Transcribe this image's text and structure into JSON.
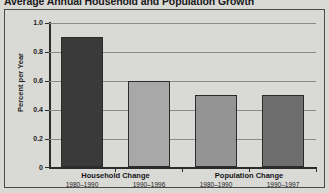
{
  "chart_data": {
    "type": "bar",
    "title": "Average Annual Household and Population Growth",
    "xlabel": "",
    "ylabel": "Percent per Year",
    "ylim": [
      0,
      1.0
    ],
    "ytick_labels": [
      "1.0",
      "0.8",
      "0.6",
      "0.4",
      "0.2",
      "0"
    ],
    "ytick_values": [
      1.0,
      0.8,
      0.6,
      0.4,
      0.2,
      0
    ],
    "grid": true,
    "legend": "none",
    "categories": [
      "1980–1990",
      "1990–1996",
      "1980–1990",
      "1990–1997"
    ],
    "values": [
      0.9,
      0.6,
      0.5,
      0.5
    ],
    "bar_colors": [
      "#3a3a3a",
      "#a8a8a8",
      "#949494",
      "#6e6e6e"
    ],
    "groups": [
      {
        "label": "Household Change",
        "bars": [
          {
            "range": "1980–1990",
            "value": 0.9,
            "color": "#3a3a3a"
          },
          {
            "range": "1990–1996",
            "value": 0.6,
            "color": "#a8a8a8"
          }
        ]
      },
      {
        "label": "Population Change",
        "bars": [
          {
            "range": "1980–1990",
            "value": 0.5,
            "color": "#949494"
          },
          {
            "range": "1990–1997",
            "value": 0.5,
            "color": "#6e6e6e"
          }
        ]
      }
    ]
  },
  "colors": {
    "background": "#d9d9d6",
    "axis": "#2b2b2b",
    "gridline": "#8a8a87",
    "border": "#4a4a4a",
    "text": "#1f1f1f"
  }
}
